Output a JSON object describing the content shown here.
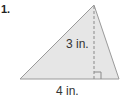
{
  "problem": {
    "number": "1.",
    "height_label": "3 in.",
    "base_label": "4 in.",
    "fill_color": "#e6e6e6",
    "stroke_color": "#9a9a9a"
  }
}
